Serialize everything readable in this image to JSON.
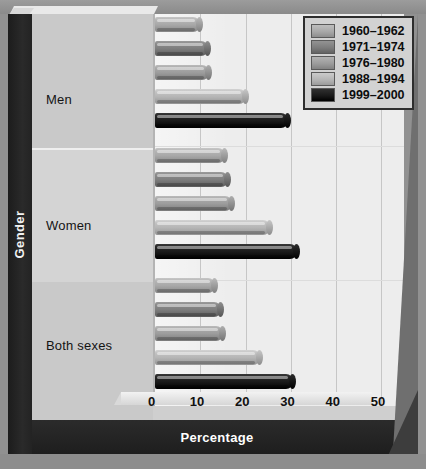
{
  "chart_data": {
    "type": "bar",
    "orientation": "horizontal",
    "title": "",
    "xlabel": "Percentage",
    "ylabel": "Gender",
    "categories": [
      "Men",
      "Women",
      "Both sexes"
    ],
    "xlim": [
      0,
      55
    ],
    "xticks": [
      0,
      10,
      20,
      30,
      40,
      50
    ],
    "xticklabels": [
      "0",
      "10",
      "20",
      "30",
      "40",
      "50"
    ],
    "grid": true,
    "legend_position": "top-right",
    "series": [
      {
        "name": "1960–1962",
        "color": "#a8a8a8",
        "values": [
          10.0,
          15.4,
          13.3
        ]
      },
      {
        "name": "1971–1974",
        "color": "#7d7d7d",
        "values": [
          11.8,
          16.1,
          14.6
        ]
      },
      {
        "name": "1976–1980",
        "color": "#9c9c9c",
        "values": [
          12.0,
          17.0,
          15.1
        ]
      },
      {
        "name": "1988–1994",
        "color": "#b5b5b5",
        "values": [
          20.2,
          25.5,
          23.3
        ]
      },
      {
        "name": "1999–2000",
        "color": "#1a1a1a",
        "values": [
          29.3,
          31.3,
          30.5
        ]
      }
    ]
  },
  "legend": {
    "items": [
      {
        "label": "1960–1962",
        "color": "#a8a8a8"
      },
      {
        "label": "1971–1974",
        "color": "#7d7d7d"
      },
      {
        "label": "1976–1980",
        "color": "#9c9c9c"
      },
      {
        "label": "1988–1994",
        "color": "#b5b5b5"
      },
      {
        "label": "1999–2000",
        "color": "#1a1a1a"
      }
    ]
  },
  "axes": {
    "x_title": "Percentage",
    "y_title": "Gender"
  },
  "colors": {
    "panel": "#cfcfcf",
    "plot_background": "#ededed",
    "frame_dark": "#242424",
    "gridline": "#c6c6c6"
  }
}
